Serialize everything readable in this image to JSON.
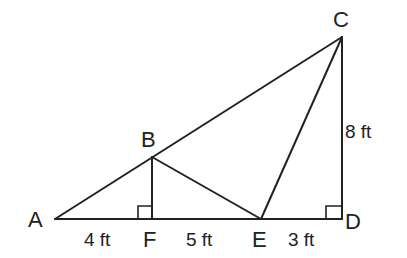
{
  "diagram": {
    "title": "",
    "points": {
      "A": {
        "label": "A",
        "x": 55,
        "y": 219
      },
      "B": {
        "label": "B",
        "x": 152,
        "y": 157
      },
      "C": {
        "label": "C",
        "x": 342,
        "y": 37
      },
      "D": {
        "label": "D",
        "x": 342,
        "y": 219
      },
      "E": {
        "label": "E",
        "x": 261,
        "y": 219
      },
      "F": {
        "label": "F",
        "x": 152,
        "y": 219
      }
    },
    "segments": [
      [
        "A",
        "C"
      ],
      [
        "A",
        "D"
      ],
      [
        "C",
        "D"
      ],
      [
        "B",
        "F"
      ],
      [
        "B",
        "E"
      ],
      [
        "C",
        "E"
      ]
    ],
    "right_angles": [
      "F",
      "D"
    ],
    "measurements": {
      "AF": "4 ft",
      "FE": "5 ft",
      "ED": "3 ft",
      "CD": "8 ft"
    },
    "line_color": "#222222"
  }
}
